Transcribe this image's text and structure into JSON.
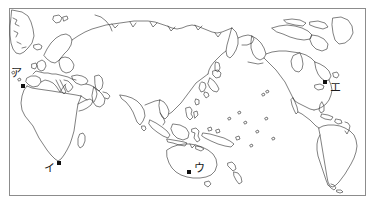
{
  "figure": {
    "kind": "world-map-outline",
    "projection": "pacific-centered",
    "background_color": "#ffffff",
    "coastline_color": "#2b2b2b",
    "frame_color": "#8c8c8c",
    "marker_color": "#111111",
    "label_color": "#1a1a1a"
  },
  "markers": [
    {
      "id": "a",
      "label": "ア",
      "region": "northwest-africa",
      "marker_x": 21,
      "marker_y": 84,
      "label_x": 11,
      "label_y": 68
    },
    {
      "id": "i",
      "label": "イ",
      "region": "southern-africa",
      "marker_x": 57,
      "marker_y": 161,
      "label_x": 44,
      "label_y": 163
    },
    {
      "id": "u",
      "label": "ウ",
      "region": "southeastern-australia",
      "marker_x": 187,
      "marker_y": 170,
      "label_x": 194,
      "label_y": 163
    },
    {
      "id": "e",
      "label": "エ",
      "region": "northeastern-north-america",
      "marker_x": 323,
      "marker_y": 80,
      "label_x": 330,
      "label_y": 82
    }
  ]
}
